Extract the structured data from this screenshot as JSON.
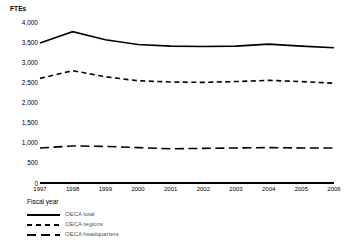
{
  "chart_data": {
    "type": "line",
    "title": "",
    "xlabel": "Fiscal year",
    "ylabel": "FTEs",
    "x": [
      1997,
      1998,
      1999,
      2000,
      2001,
      2002,
      2003,
      2004,
      2005,
      2006
    ],
    "categories": [
      "1997",
      "1998",
      "1999",
      "2000",
      "2001",
      "2002",
      "2003",
      "2004",
      "2005",
      "2006"
    ],
    "ylim": [
      0,
      4000
    ],
    "yticks": [
      0,
      500,
      1000,
      1500,
      2000,
      2500,
      3000,
      3500,
      4000
    ],
    "ytick_labels": [
      "0",
      "500",
      "1,000",
      "1,500",
      "2,000",
      "2,500",
      "3,000",
      "3,500",
      "4,000"
    ],
    "grid": false,
    "legend_position": "below-left",
    "series": [
      {
        "name": "OECA total",
        "style": "solid",
        "values": [
          3480,
          3760,
          3560,
          3440,
          3400,
          3390,
          3400,
          3450,
          3400,
          3360
        ]
      },
      {
        "name": "OECA regions",
        "style": "dashed-small",
        "values": [
          2600,
          2790,
          2640,
          2540,
          2510,
          2500,
          2520,
          2550,
          2520,
          2480
        ]
      },
      {
        "name": "OECA headquarters",
        "style": "dashed-large",
        "values": [
          870,
          920,
          910,
          880,
          850,
          860,
          870,
          880,
          870,
          870
        ]
      }
    ]
  },
  "axis": {
    "y_title": "FTEs",
    "x_title": "Fiscal year"
  }
}
